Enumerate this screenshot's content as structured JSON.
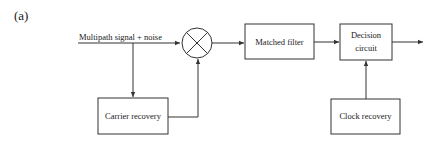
{
  "figure": {
    "panel_label": "(a)",
    "input_signal": "Multipath signal + noise",
    "blocks": {
      "mixer": {
        "symbol": "×"
      },
      "matched_filter": {
        "label": "Matched filter"
      },
      "decision_circuit": {
        "line1": "Decision",
        "line2": "circuit"
      },
      "carrier_recovery": {
        "label": "Carrier recovery"
      },
      "clock_recovery": {
        "label": "Clock recovery"
      }
    },
    "colors": {
      "stroke": "#333333",
      "background": "#ffffff"
    }
  }
}
